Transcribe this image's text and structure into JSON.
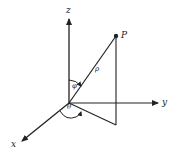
{
  "diagram": {
    "colors": {
      "stroke": "#222222",
      "background": "#ffffff"
    },
    "axes": {
      "z": {
        "label": "z"
      },
      "y": {
        "label": "y"
      },
      "x": {
        "label": "x"
      }
    },
    "point": {
      "label": "P"
    },
    "symbols": {
      "rho": "ρ",
      "phi": "φ",
      "theta": "θ"
    }
  }
}
